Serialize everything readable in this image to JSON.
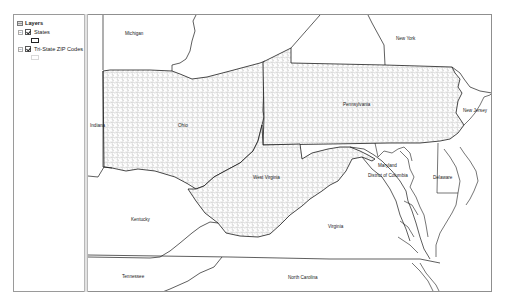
{
  "toc": {
    "root_label": "Layers",
    "root_icon": "layers-icon",
    "layers": [
      {
        "label": "States",
        "checked": true,
        "expanded": true,
        "symbol": "hollow-polygon-black"
      },
      {
        "label": "Tri-State ZIP Codes",
        "checked": true,
        "expanded": true,
        "symbol": "hollow-polygon-light-gray"
      }
    ]
  },
  "map": {
    "labels": {
      "michigan": "Michigan",
      "new_york": "New York",
      "indiana": "Indiana",
      "ohio": "Ohio",
      "pennsylvania": "Pennsylvania",
      "new_jersey": "New Jersey",
      "maryland": "Maryland",
      "district_of_columbia": "District of Columbia",
      "delaware": "Delaware",
      "west_virginia": "West Virginia",
      "kentucky": "Kentucky",
      "virginia": "Virginia",
      "tennessee": "Tennessee",
      "north_carolina": "North Carolina"
    },
    "colors": {
      "state_outline": "#1a1a1a",
      "zip_outline": "#9a9a9a",
      "background": "#ffffff"
    }
  }
}
